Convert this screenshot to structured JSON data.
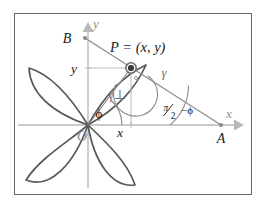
{
  "figure": {
    "kind": "geometry-diagram",
    "frame": {
      "stroke": "#6a6a6a",
      "fill": "#ffffff",
      "x": 14,
      "y": 13,
      "width": 238,
      "height": 182
    }
  },
  "colors": {
    "curve": "#595959",
    "axis": "#b9b9b9",
    "helper_line": "#9a9a9a",
    "construction": "#8c8c8c",
    "point_fill": "#3a3a3a",
    "point_ring": "#6e6e6e",
    "label_text": "#1a1a1a",
    "axis_label_text": "#8d8d8d",
    "frame": "#6a6a6a",
    "background": "#ffffff"
  },
  "axes": {
    "x_label": "x",
    "y_label": "y",
    "origin_label": "O",
    "x_axis_y": 125,
    "y_axis_x": 88,
    "x_arrow_tip": 243,
    "y_arrow_tip": 22
  },
  "points": [
    {
      "name": "P",
      "label": "P = (x, y)",
      "x": 131,
      "y": 68,
      "style": "ring-dot"
    },
    {
      "name": "A",
      "label": "A",
      "x": 221,
      "y": 125,
      "style": "small-dot"
    },
    {
      "name": "B",
      "label": "B",
      "x": 85,
      "y": 38,
      "style": "small-dot"
    },
    {
      "name": "O",
      "label": "O",
      "x": 88,
      "y": 125,
      "style": "origin"
    }
  ],
  "coordinate_labels": {
    "x_projection": "x",
    "y_projection": "y"
  },
  "angle_labels": {
    "phi": "ϕ",
    "gamma": "γ",
    "gamma_perp": "γ⊥",
    "complement_numerator": "π",
    "complement_denominator": "2",
    "complement_suffix": "−ϕ",
    "complement_full": "π/2−ϕ"
  },
  "rose": {
    "type": "four-petal-rose",
    "petal_count": 4,
    "rotation_deg": 45,
    "petal_length_px": 82,
    "petal_width_factor": 0.52,
    "center": {
      "x": 88,
      "y": 125
    }
  }
}
